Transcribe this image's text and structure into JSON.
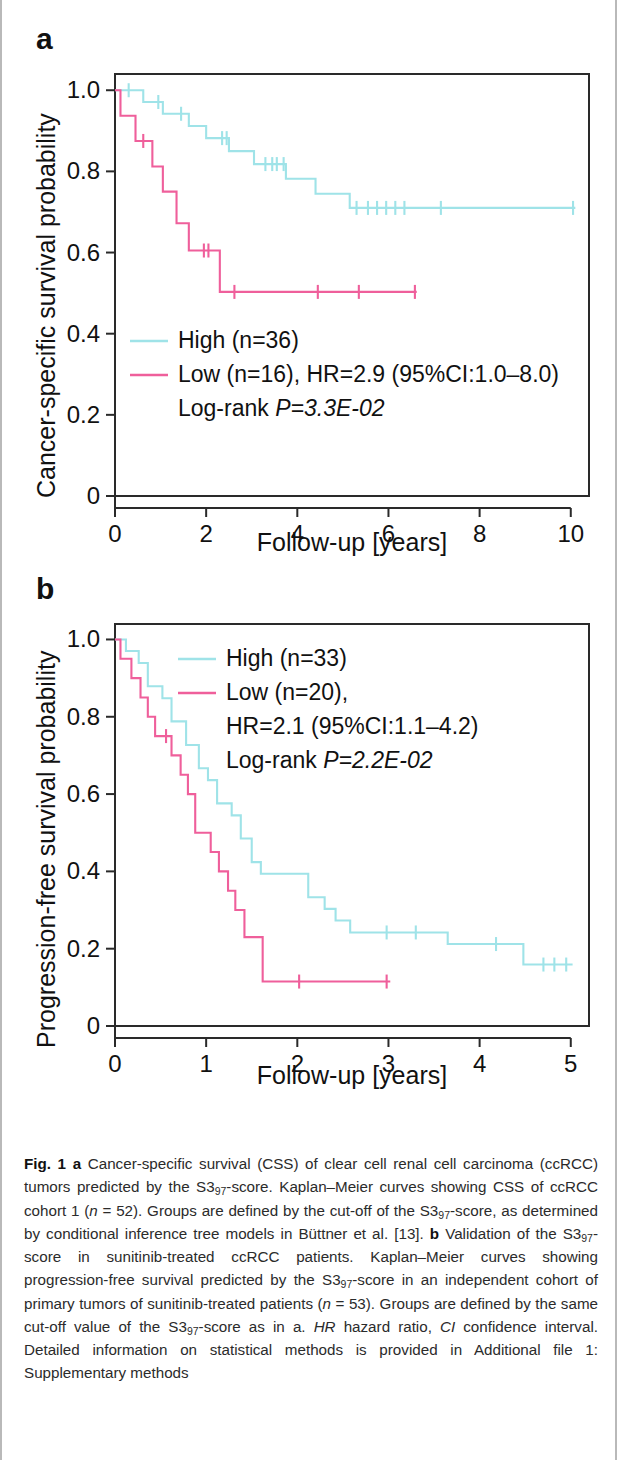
{
  "figure": {
    "panels": [
      {
        "label": "a"
      },
      {
        "label": "b"
      }
    ]
  },
  "panel_a": {
    "label": "a",
    "ylabel": "Cancer-specific survival probability",
    "xlabel": "Follow-up [years]",
    "yticks": [
      "0",
      "0.2",
      "0.4",
      "0.6",
      "0.8",
      "1.0"
    ],
    "xticks": [
      "0",
      "2",
      "4",
      "6",
      "8",
      "10"
    ],
    "legend": {
      "high": "High (n=36)",
      "low": "Low (n=16), HR=2.9 (95%CI:1.0–8.0)",
      "logrank_prefix": "Log-rank ",
      "logrank_stat": "P=3.3E-02"
    }
  },
  "panel_b": {
    "label": "b",
    "ylabel": "Progression-free survival probability",
    "xlabel": "Follow-up [years]",
    "yticks": [
      "0",
      "0.2",
      "0.4",
      "0.6",
      "0.8",
      "1.0"
    ],
    "xticks": [
      "0",
      "1",
      "2",
      "3",
      "4",
      "5"
    ],
    "legend": {
      "high": "High (n=33)",
      "low": "Low (n=20),",
      "low2": "HR=2.1 (95%CI:1.1–4.2)",
      "logrank_prefix": "Log-rank ",
      "logrank_stat": "P=2.2E-02"
    }
  },
  "colors": {
    "high": "#9fe3e8",
    "low": "#ef5f9b",
    "axis": "#2a2a2a",
    "text": "#111111",
    "caption": "#2b2b2b",
    "page_border": "#b9b9b9"
  },
  "caption": {
    "fig_label": "Fig. 1",
    "text_runs": [
      {
        "t": "Fig. 1",
        "s": "b"
      },
      {
        "t": " ",
        "s": "n"
      },
      {
        "t": "a",
        "s": "b"
      },
      {
        "t": " Cancer-specific survival (CSS) of clear cell renal cell carcinoma (ccRCC) tumors predicted by the S3",
        "s": "n"
      },
      {
        "t": "97",
        "s": "sub"
      },
      {
        "t": "-score. Kaplan–Meier curves showing CSS of ccRCC cohort 1 (",
        "s": "n"
      },
      {
        "t": "n",
        "s": "i"
      },
      {
        "t": " = 52). Groups are defined by the cut-off of the S3",
        "s": "n"
      },
      {
        "t": "97",
        "s": "sub"
      },
      {
        "t": "-score, as determined by conditional inference tree models in Büttner et al. [13]. ",
        "s": "n"
      },
      {
        "t": "b",
        "s": "b"
      },
      {
        "t": " Validation of the S3",
        "s": "n"
      },
      {
        "t": "97",
        "s": "sub"
      },
      {
        "t": "-score in sunitinib-treated ccRCC patients. Kaplan–Meier curves showing progression-free survival predicted by the S3",
        "s": "n"
      },
      {
        "t": "97",
        "s": "sub"
      },
      {
        "t": "-score in an independent cohort of primary tumors of sunitinib-treated patients (",
        "s": "n"
      },
      {
        "t": "n",
        "s": "i"
      },
      {
        "t": " = 53). Groups are defined by the same cut-off value of the S3",
        "s": "n"
      },
      {
        "t": "97",
        "s": "sub"
      },
      {
        "t": "-score as in a. ",
        "s": "n"
      },
      {
        "t": "HR",
        "s": "i"
      },
      {
        "t": " hazard ratio, ",
        "s": "n"
      },
      {
        "t": "CI",
        "s": "i"
      },
      {
        "t": " confidence interval. Detailed information on statistical methods is provided in Additional file 1: Supplementary methods",
        "s": "n"
      }
    ]
  },
  "chart_data": [
    {
      "id": "panel_a",
      "type": "line",
      "subtype": "kaplan-meier",
      "title": "a",
      "xlabel": "Follow-up [years]",
      "ylabel": "Cancer-specific survival probability",
      "xlim": [
        0,
        10.4
      ],
      "ylim": [
        0,
        1.04
      ],
      "xticks": [
        0,
        2,
        4,
        6,
        8,
        10
      ],
      "yticks": [
        0,
        0.2,
        0.4,
        0.6,
        0.8,
        1.0
      ],
      "grid": false,
      "legend_position": "lower-left-inside",
      "annotations": [
        "High (n=36)",
        "Low (n=16), HR=2.9 (95%CI:1.0–8.0)",
        "Log-rank P=3.3E-02"
      ],
      "stats": {
        "HR": 2.9,
        "CI_low": 1.0,
        "CI_high": 8.0,
        "logrank_P": "3.3E-02",
        "n_high": 36,
        "n_low": 16,
        "n_total": 52
      },
      "series": [
        {
          "name": "High (n=36)",
          "color": "#9fe3e8",
          "n": 36,
          "steps": [
            [
              0.0,
              1.0
            ],
            [
              0.62,
              1.0
            ],
            [
              0.62,
              0.971
            ],
            [
              1.05,
              0.971
            ],
            [
              1.05,
              0.942
            ],
            [
              1.62,
              0.942
            ],
            [
              1.62,
              0.912
            ],
            [
              2.0,
              0.912
            ],
            [
              2.0,
              0.882
            ],
            [
              2.5,
              0.882
            ],
            [
              2.5,
              0.85
            ],
            [
              3.05,
              0.85
            ],
            [
              3.05,
              0.818
            ],
            [
              3.75,
              0.818
            ],
            [
              3.75,
              0.782
            ],
            [
              4.4,
              0.782
            ],
            [
              4.4,
              0.745
            ],
            [
              5.15,
              0.745
            ],
            [
              5.15,
              0.71
            ],
            [
              10.1,
              0.71
            ]
          ],
          "censored": [
            [
              0.3,
              1.0
            ],
            [
              0.95,
              0.971
            ],
            [
              1.45,
              0.942
            ],
            [
              2.35,
              0.882
            ],
            [
              2.45,
              0.882
            ],
            [
              3.3,
              0.818
            ],
            [
              3.45,
              0.818
            ],
            [
              3.55,
              0.818
            ],
            [
              3.7,
              0.818
            ],
            [
              5.3,
              0.71
            ],
            [
              5.55,
              0.71
            ],
            [
              5.75,
              0.71
            ],
            [
              5.95,
              0.71
            ],
            [
              6.15,
              0.71
            ],
            [
              6.35,
              0.71
            ],
            [
              7.15,
              0.71
            ],
            [
              10.05,
              0.71
            ]
          ]
        },
        {
          "name": "Low (n=16)",
          "color": "#ef5f9b",
          "n": 16,
          "steps": [
            [
              0.0,
              1.0
            ],
            [
              0.12,
              1.0
            ],
            [
              0.12,
              0.937
            ],
            [
              0.45,
              0.937
            ],
            [
              0.45,
              0.875
            ],
            [
              0.82,
              0.875
            ],
            [
              0.82,
              0.812
            ],
            [
              1.05,
              0.812
            ],
            [
              1.05,
              0.75
            ],
            [
              1.35,
              0.75
            ],
            [
              1.35,
              0.672
            ],
            [
              1.62,
              0.672
            ],
            [
              1.62,
              0.605
            ],
            [
              2.3,
              0.605
            ],
            [
              2.3,
              0.503
            ],
            [
              6.62,
              0.503
            ]
          ],
          "censored": [
            [
              0.62,
              0.875
            ],
            [
              1.95,
              0.605
            ],
            [
              2.05,
              0.605
            ],
            [
              2.62,
              0.503
            ],
            [
              4.45,
              0.503
            ],
            [
              5.35,
              0.503
            ],
            [
              6.58,
              0.503
            ]
          ]
        }
      ]
    },
    {
      "id": "panel_b",
      "type": "line",
      "subtype": "kaplan-meier",
      "title": "b",
      "xlabel": "Follow-up [years]",
      "ylabel": "Progression-free survival probability",
      "xlim": [
        0,
        5.2
      ],
      "ylim": [
        0,
        1.04
      ],
      "xticks": [
        0,
        1,
        2,
        3,
        4,
        5
      ],
      "yticks": [
        0,
        0.2,
        0.4,
        0.6,
        0.8,
        1.0
      ],
      "grid": false,
      "legend_position": "upper-right-inside",
      "annotations": [
        "High (n=33)",
        "Low (n=20),",
        "HR=2.1 (95%CI:1.1–4.2)",
        "Log-rank P=2.2E-02"
      ],
      "stats": {
        "HR": 2.1,
        "CI_low": 1.1,
        "CI_high": 4.2,
        "logrank_P": "2.2E-02",
        "n_high": 33,
        "n_low": 20,
        "n_total": 53
      },
      "series": [
        {
          "name": "High (n=33)",
          "color": "#9fe3e8",
          "n": 33,
          "steps": [
            [
              0.0,
              1.0
            ],
            [
              0.12,
              1.0
            ],
            [
              0.12,
              0.97
            ],
            [
              0.26,
              0.97
            ],
            [
              0.26,
              0.939
            ],
            [
              0.36,
              0.939
            ],
            [
              0.36,
              0.879
            ],
            [
              0.52,
              0.879
            ],
            [
              0.52,
              0.848
            ],
            [
              0.62,
              0.848
            ],
            [
              0.62,
              0.788
            ],
            [
              0.78,
              0.788
            ],
            [
              0.78,
              0.727
            ],
            [
              0.92,
              0.727
            ],
            [
              0.92,
              0.667
            ],
            [
              1.02,
              0.667
            ],
            [
              1.02,
              0.636
            ],
            [
              1.12,
              0.636
            ],
            [
              1.12,
              0.576
            ],
            [
              1.28,
              0.576
            ],
            [
              1.28,
              0.545
            ],
            [
              1.38,
              0.545
            ],
            [
              1.38,
              0.485
            ],
            [
              1.5,
              0.485
            ],
            [
              1.5,
              0.424
            ],
            [
              1.6,
              0.424
            ],
            [
              1.6,
              0.394
            ],
            [
              2.12,
              0.394
            ],
            [
              2.12,
              0.333
            ],
            [
              2.3,
              0.333
            ],
            [
              2.3,
              0.303
            ],
            [
              2.42,
              0.303
            ],
            [
              2.42,
              0.273
            ],
            [
              2.58,
              0.273
            ],
            [
              2.58,
              0.242
            ],
            [
              3.65,
              0.242
            ],
            [
              3.65,
              0.212
            ],
            [
              4.48,
              0.212
            ],
            [
              4.48,
              0.159
            ],
            [
              5.02,
              0.159
            ]
          ],
          "censored": [
            [
              2.98,
              0.242
            ],
            [
              3.3,
              0.242
            ],
            [
              4.18,
              0.212
            ],
            [
              4.7,
              0.159
            ],
            [
              4.82,
              0.159
            ],
            [
              4.95,
              0.159
            ]
          ]
        },
        {
          "name": "Low (n=20)",
          "color": "#ef5f9b",
          "n": 20,
          "steps": [
            [
              0.0,
              1.0
            ],
            [
              0.06,
              1.0
            ],
            [
              0.06,
              0.95
            ],
            [
              0.18,
              0.95
            ],
            [
              0.18,
              0.9
            ],
            [
              0.28,
              0.9
            ],
            [
              0.28,
              0.85
            ],
            [
              0.36,
              0.85
            ],
            [
              0.36,
              0.8
            ],
            [
              0.44,
              0.8
            ],
            [
              0.44,
              0.75
            ],
            [
              0.62,
              0.75
            ],
            [
              0.62,
              0.7
            ],
            [
              0.72,
              0.7
            ],
            [
              0.72,
              0.65
            ],
            [
              0.8,
              0.65
            ],
            [
              0.8,
              0.6
            ],
            [
              0.88,
              0.6
            ],
            [
              0.88,
              0.5
            ],
            [
              1.05,
              0.5
            ],
            [
              1.05,
              0.45
            ],
            [
              1.14,
              0.45
            ],
            [
              1.14,
              0.4
            ],
            [
              1.24,
              0.4
            ],
            [
              1.24,
              0.35
            ],
            [
              1.32,
              0.35
            ],
            [
              1.32,
              0.3
            ],
            [
              1.42,
              0.3
            ],
            [
              1.42,
              0.23
            ],
            [
              1.62,
              0.23
            ],
            [
              1.62,
              0.115
            ],
            [
              3.02,
              0.115
            ]
          ],
          "censored": [
            [
              0.56,
              0.75
            ],
            [
              2.02,
              0.115
            ],
            [
              2.98,
              0.115
            ]
          ]
        }
      ]
    }
  ]
}
